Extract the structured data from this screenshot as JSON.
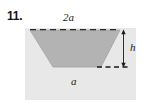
{
  "figure": {
    "problem_number": "11.",
    "labels": {
      "top_width": "2a",
      "bottom_width": "a",
      "height": "h"
    },
    "colors": {
      "page_background": "#ffffff",
      "ground_fill": "#e8e8e8",
      "trapezoid_fill": "#b3b3b3",
      "trapezoid_stroke": "#9a9a9a",
      "dashed_line": "#1a1a1a",
      "arrow": "#1a1a1a",
      "text": "#141414"
    },
    "geometry": {
      "ground_rect": {
        "x": 25,
        "y": 28,
        "width": 111,
        "height": 72
      },
      "trapezoid_points": "30,30 120,30 101,67 53,67",
      "top_dashed_line": {
        "x1": 30,
        "y1": 29.5,
        "x2": 120,
        "y2": 29.5
      },
      "bottom_dashed_line": {
        "x1": 98,
        "y1": 67,
        "x2": 129,
        "y2": 67
      },
      "height_arrow": {
        "x": 123,
        "y_top": 30,
        "y_bottom": 67
      }
    },
    "shape_type": "inverted-trapezoid-cross-section",
    "description_parts": {
      "top_edge": "2a",
      "bottom_edge": "a",
      "depth": "h"
    }
  }
}
